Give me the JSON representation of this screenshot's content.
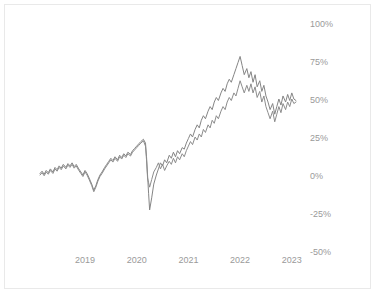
{
  "card": {
    "background_color": "#ffffff",
    "border_color": "#e9e9e9"
  },
  "chart_data": {
    "type": "line",
    "title": "",
    "subtitle": "",
    "xlabel": "",
    "ylabel": "",
    "grid": false,
    "legend": "none",
    "line_color": "#858585",
    "tick_color": "#9a9a9a",
    "x_tick_labels": [
      "2019",
      "2020",
      "2021",
      "2022",
      "2023"
    ],
    "x_tick_values": [
      2019,
      2020,
      2021,
      2022,
      2023
    ],
    "y_tick_labels": [
      "100%",
      "75%",
      "50%",
      "25%",
      "0%",
      "-25%",
      "-50%"
    ],
    "y_tick_values": [
      100,
      75,
      50,
      25,
      0,
      -25,
      -50
    ],
    "ylim": [
      -50,
      100
    ],
    "xlim": [
      2018.13,
      2023.08
    ],
    "y_unit": "%",
    "series": [
      {
        "name": "series-a",
        "color": "#858585",
        "x": [
          2018.13,
          2018.17,
          2018.21,
          2018.25,
          2018.29,
          2018.33,
          2018.38,
          2018.42,
          2018.46,
          2018.5,
          2018.54,
          2018.58,
          2018.63,
          2018.67,
          2018.71,
          2018.75,
          2018.79,
          2018.83,
          2018.88,
          2018.92,
          2018.96,
          2019.0,
          2019.04,
          2019.08,
          2019.13,
          2019.17,
          2019.21,
          2019.25,
          2019.29,
          2019.33,
          2019.38,
          2019.42,
          2019.46,
          2019.5,
          2019.54,
          2019.58,
          2019.63,
          2019.67,
          2019.71,
          2019.75,
          2019.79,
          2019.83,
          2019.88,
          2019.92,
          2019.96,
          2020.0,
          2020.04,
          2020.08,
          2020.13,
          2020.17,
          2020.19,
          2020.21,
          2020.23,
          2020.25,
          2020.29,
          2020.33,
          2020.38,
          2020.42,
          2020.46,
          2020.5,
          2020.54,
          2020.58,
          2020.63,
          2020.67,
          2020.71,
          2020.75,
          2020.79,
          2020.83,
          2020.88,
          2020.92,
          2020.96,
          2021.0,
          2021.04,
          2021.08,
          2021.13,
          2021.17,
          2021.21,
          2021.25,
          2021.29,
          2021.33,
          2021.38,
          2021.42,
          2021.46,
          2021.5,
          2021.54,
          2021.58,
          2021.63,
          2021.67,
          2021.71,
          2021.75,
          2021.79,
          2021.83,
          2021.88,
          2021.92,
          2021.96,
          2022.0,
          2022.04,
          2022.08,
          2022.13,
          2022.17,
          2022.21,
          2022.25,
          2022.29,
          2022.33,
          2022.38,
          2022.42,
          2022.46,
          2022.5,
          2022.54,
          2022.58,
          2022.63,
          2022.67,
          2022.71,
          2022.75,
          2022.79,
          2022.83,
          2022.88,
          2022.92,
          2022.96,
          2023.0,
          2023.04,
          2023.08
        ],
        "y": [
          1.0,
          2.5,
          0.5,
          3.0,
          1.5,
          4.0,
          2.0,
          5.0,
          3.5,
          6.0,
          4.5,
          7.0,
          5.0,
          7.5,
          6.0,
          8.0,
          5.5,
          7.0,
          4.0,
          2.0,
          0.0,
          3.0,
          1.0,
          -2.0,
          -6.0,
          -10.0,
          -7.0,
          -3.0,
          0.0,
          2.0,
          5.0,
          7.0,
          9.0,
          11.0,
          9.5,
          12.0,
          10.0,
          13.0,
          11.5,
          14.0,
          12.5,
          15.0,
          13.5,
          16.0,
          17.5,
          19.0,
          20.5,
          22.0,
          23.5,
          21.0,
          12.0,
          0.0,
          -12.0,
          -23.0,
          -15.0,
          -6.0,
          0.0,
          4.0,
          8.0,
          6.0,
          10.0,
          8.0,
          13.0,
          11.0,
          15.0,
          12.0,
          16.0,
          14.0,
          18.0,
          17.0,
          21.0,
          24.0,
          27.0,
          25.0,
          30.0,
          33.0,
          31.0,
          36.0,
          39.0,
          37.0,
          42.0,
          45.0,
          43.0,
          48.0,
          51.0,
          49.0,
          54.0,
          57.0,
          55.0,
          60.0,
          63.0,
          61.0,
          66.0,
          70.0,
          74.0,
          78.0,
          72.0,
          66.0,
          70.0,
          64.0,
          68.0,
          61.0,
          66.0,
          58.0,
          62.0,
          55.0,
          59.0,
          52.0,
          48.0,
          43.0,
          47.0,
          40.0,
          45.0,
          50.0,
          46.0,
          52.0,
          48.0,
          53.0,
          49.0,
          54.0,
          50.0,
          49.0
        ]
      },
      {
        "name": "series-b",
        "color": "#8c8c8c",
        "x": [
          2018.13,
          2018.17,
          2018.21,
          2018.25,
          2018.29,
          2018.33,
          2018.38,
          2018.42,
          2018.46,
          2018.5,
          2018.54,
          2018.58,
          2018.63,
          2018.67,
          2018.71,
          2018.75,
          2018.79,
          2018.83,
          2018.88,
          2018.92,
          2018.96,
          2019.0,
          2019.04,
          2019.08,
          2019.13,
          2019.17,
          2019.21,
          2019.25,
          2019.29,
          2019.33,
          2019.38,
          2019.42,
          2019.46,
          2019.5,
          2019.54,
          2019.58,
          2019.63,
          2019.67,
          2019.71,
          2019.75,
          2019.79,
          2019.83,
          2019.88,
          2019.92,
          2019.96,
          2020.0,
          2020.04,
          2020.08,
          2020.13,
          2020.17,
          2020.19,
          2020.21,
          2020.23,
          2020.25,
          2020.29,
          2020.33,
          2020.38,
          2020.42,
          2020.46,
          2020.5,
          2020.54,
          2020.58,
          2020.63,
          2020.67,
          2020.71,
          2020.75,
          2020.79,
          2020.83,
          2020.88,
          2020.92,
          2020.96,
          2021.0,
          2021.04,
          2021.08,
          2021.13,
          2021.17,
          2021.21,
          2021.25,
          2021.29,
          2021.33,
          2021.38,
          2021.42,
          2021.46,
          2021.5,
          2021.54,
          2021.58,
          2021.63,
          2021.67,
          2021.71,
          2021.75,
          2021.79,
          2021.83,
          2021.88,
          2021.92,
          2021.96,
          2022.0,
          2022.04,
          2022.08,
          2022.13,
          2022.17,
          2022.21,
          2022.25,
          2022.29,
          2022.33,
          2022.38,
          2022.42,
          2022.46,
          2022.5,
          2022.54,
          2022.58,
          2022.63,
          2022.67,
          2022.71,
          2022.75,
          2022.79,
          2022.83,
          2022.88,
          2022.92,
          2022.96,
          2023.0,
          2023.04,
          2023.08
        ],
        "y": [
          0.0,
          1.5,
          -0.5,
          2.0,
          0.5,
          3.0,
          1.0,
          4.0,
          2.5,
          5.0,
          3.5,
          6.0,
          4.0,
          6.5,
          5.0,
          7.0,
          4.5,
          6.0,
          3.0,
          1.0,
          -1.0,
          2.0,
          0.0,
          -3.0,
          -7.0,
          -11.0,
          -8.0,
          -4.0,
          -1.0,
          1.0,
          4.0,
          6.0,
          8.0,
          10.0,
          8.5,
          11.0,
          9.0,
          12.0,
          10.5,
          13.0,
          11.5,
          14.0,
          12.5,
          15.0,
          16.5,
          18.0,
          19.5,
          21.0,
          22.5,
          19.0,
          10.0,
          -2.0,
          -5.0,
          -8.0,
          -3.0,
          2.0,
          5.0,
          8.0,
          4.0,
          7.0,
          3.0,
          6.0,
          9.0,
          7.0,
          11.0,
          8.0,
          12.0,
          10.0,
          14.0,
          12.0,
          16.0,
          19.0,
          22.0,
          20.0,
          25.0,
          23.0,
          27.0,
          25.0,
          30.0,
          28.0,
          33.0,
          31.0,
          36.0,
          34.0,
          39.0,
          37.0,
          42.0,
          45.0,
          43.0,
          48.0,
          51.0,
          49.0,
          54.0,
          52.0,
          57.0,
          62.0,
          58.0,
          54.0,
          59.0,
          55.0,
          60.0,
          54.0,
          58.0,
          51.0,
          55.0,
          48.0,
          52.0,
          45.0,
          41.0,
          37.0,
          42.0,
          35.0,
          40.0,
          45.0,
          41.0,
          47.0,
          43.0,
          48.0,
          45.0,
          50.0,
          47.0,
          48.0
        ]
      }
    ]
  }
}
